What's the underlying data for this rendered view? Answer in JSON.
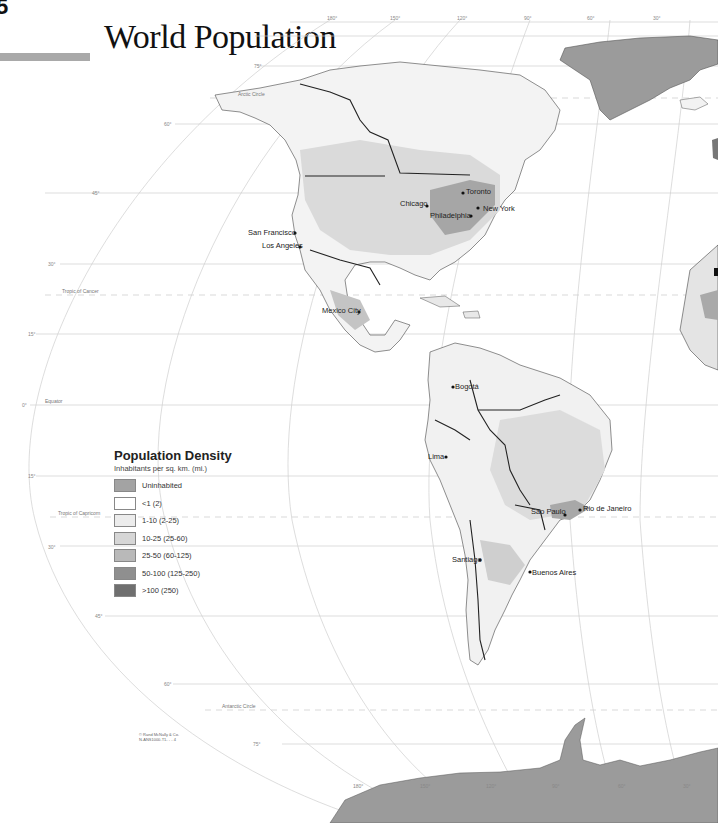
{
  "page": {
    "number": "5",
    "title": "World Population"
  },
  "map": {
    "longitude_labels": [
      "180°",
      "150°",
      "120°",
      "90°",
      "60°",
      "30°"
    ],
    "latitude_labels": [
      "75°",
      "60°",
      "45°",
      "30°",
      "15°",
      "0°",
      "15°",
      "30°",
      "45°",
      "60°",
      "75°"
    ],
    "circles": {
      "arctic": "Arctic Circle",
      "cancer": "Tropic of Cancer",
      "equator": "Equator",
      "capricorn": "Tropic of Capricorn",
      "antarctic": "Antarctic Circle"
    },
    "cities": [
      {
        "name": "Toronto"
      },
      {
        "name": "Chicago"
      },
      {
        "name": "New York"
      },
      {
        "name": "Philadelphia"
      },
      {
        "name": "San Francisco"
      },
      {
        "name": "Los Angeles"
      },
      {
        "name": "Mexico City"
      },
      {
        "name": "Bogotá"
      },
      {
        "name": "Lima"
      },
      {
        "name": "São Paulo"
      },
      {
        "name": "Rio de Janeiro"
      },
      {
        "name": "Santiago"
      },
      {
        "name": "Buenos Aires"
      }
    ],
    "colors": {
      "ocean": "#ffffff",
      "land_low": "#f4f4f4",
      "land_mid": "#dcdcdc",
      "land_dense": "#9a9a9a",
      "uninhabited": "#9b9b9b",
      "border": "#222222",
      "grid": "#c8c8c8"
    }
  },
  "legend": {
    "title": "Population Density",
    "subtitle": "Inhabitants per sq. km. (mi.)",
    "items": [
      {
        "label": "Uninhabited",
        "color": "#a3a3a3"
      },
      {
        "label": "<1 (2)",
        "color": "#ffffff"
      },
      {
        "label": "1-10 (2-25)",
        "color": "#ececec"
      },
      {
        "label": "10-25 (25-60)",
        "color": "#d6d6d6"
      },
      {
        "label": "25-50 (60-125)",
        "color": "#b9b9b9"
      },
      {
        "label": "50-100 (125-250)",
        "color": "#8f8f8f"
      },
      {
        "label": ">100 (250)",
        "color": "#6f6f6f"
      }
    ]
  },
  "credit": {
    "line1": "© Rand McNally & Co.",
    "line2": "N-ANS1000-T1-  -  -  4"
  }
}
